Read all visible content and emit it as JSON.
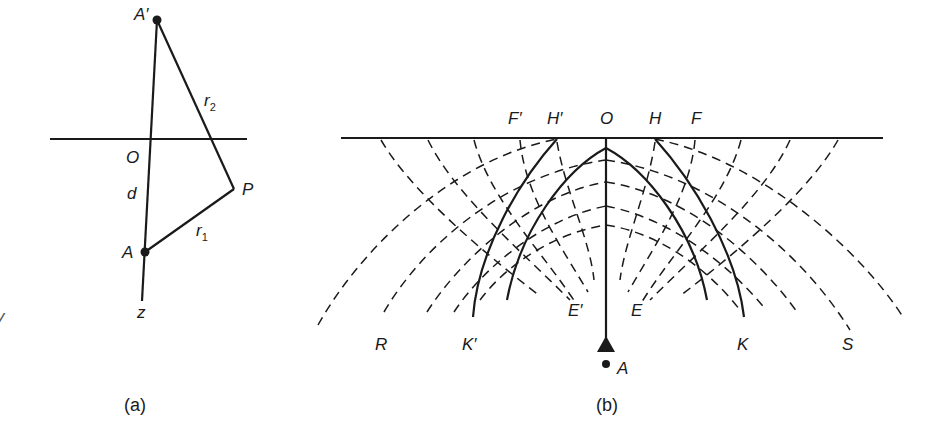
{
  "figure_a": {
    "caption": "(a)",
    "labels": {
      "A_prime": "A′",
      "O": "O",
      "d": "d",
      "P": "P",
      "A": "A",
      "z": "z",
      "r1": "r",
      "r1_sub": "1",
      "r2": "r",
      "r2_sub": "2"
    }
  },
  "figure_b": {
    "caption": "(b)",
    "labels": {
      "F_prime": "F′",
      "H_prime": "H′",
      "O": "O",
      "H": "H",
      "F": "F",
      "E_prime": "E′",
      "E": "E",
      "R": "R",
      "K_prime": "K′",
      "K": "K",
      "S": "S",
      "A": "A"
    }
  },
  "stray_mark": "y"
}
